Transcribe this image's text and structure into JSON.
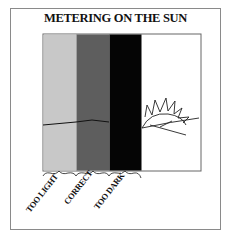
{
  "title": "METERING ON THE SUN",
  "strips": [
    {
      "name": "too-light",
      "label": "TOO LIGHT",
      "color": "#c8c8c8"
    },
    {
      "name": "correct",
      "label": "CORRECT",
      "color": "#5e5e5e"
    },
    {
      "name": "too-dark",
      "label": "TOO DARK",
      "color": "#050505"
    }
  ],
  "scene_background": "#ffffff",
  "frame_color": "#8a8a8a"
}
